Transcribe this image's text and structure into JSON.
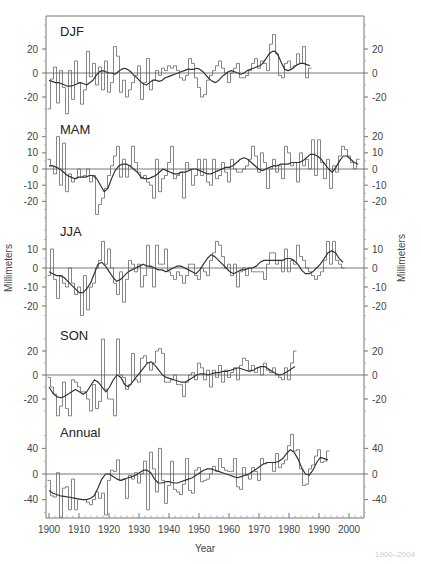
{
  "chart_data": {
    "type": "line",
    "subtype": "step-line with smoothed curve, 5 stacked panels",
    "xlabel": "Year",
    "ylabel_left": "Millimeters",
    "ylabel_right": "Millimeters",
    "xlim": [
      1899,
      2005
    ],
    "x_ticks": [
      1900,
      1910,
      1920,
      1930,
      1940,
      1950,
      1960,
      1970,
      1980,
      1990,
      2000
    ],
    "x_start": 1900,
    "grid": false,
    "legend": null,
    "panels": [
      {
        "name": "DJF",
        "ylim": [
          -32,
          45
        ],
        "y_ticks_left": [
          20,
          0,
          -20
        ],
        "y_ticks_right": [
          20,
          0,
          -20
        ],
        "annual": [
          -30,
          -5,
          5,
          -25,
          2,
          -12,
          -34,
          2,
          -22,
          10,
          -8,
          -26,
          -14,
          18,
          -3,
          8,
          -10,
          5,
          -14,
          10,
          -16,
          -8,
          22,
          14,
          -16,
          -6,
          -20,
          -14,
          -8,
          -2,
          6,
          -22,
          -8,
          12,
          -14,
          -6,
          2,
          -2,
          4,
          2,
          6,
          4,
          6,
          2,
          -4,
          -6,
          -2,
          12,
          8,
          -4,
          -12,
          -20,
          -18,
          -6,
          -2,
          2,
          6,
          10,
          4,
          0,
          -8,
          0,
          4,
          8,
          -4,
          -4,
          -2,
          2,
          8,
          12,
          4,
          10,
          8,
          2,
          24,
          32,
          16,
          -2,
          -4,
          8,
          10,
          4,
          6,
          16,
          8,
          22,
          -4,
          4
        ],
        "smoothed": [
          -6,
          -7,
          -8,
          -8,
          -9,
          -10,
          -11,
          -11,
          -10,
          -9,
          -8,
          -9,
          -10,
          -8,
          -6,
          -2,
          1,
          2,
          1,
          0,
          0,
          -1,
          1,
          3,
          4,
          3,
          1,
          -2,
          -4,
          -7,
          -9,
          -10,
          -8,
          -6,
          -6,
          -7,
          -6,
          -4,
          -3,
          -2,
          -1,
          0,
          1,
          2,
          3,
          3,
          3,
          4,
          3,
          1,
          -2,
          -5,
          -7,
          -8,
          -6,
          -3,
          -1,
          1,
          2,
          1,
          0,
          -1,
          0,
          2,
          3,
          4,
          5,
          6,
          8,
          12,
          16,
          18,
          18,
          14,
          8,
          3,
          2,
          3,
          5,
          7,
          8,
          8,
          7,
          6
        ]
      },
      {
        "name": "MAM",
        "ylim": [
          -30,
          28
        ],
        "y_ticks_left": [
          20,
          10,
          0,
          -10,
          -20
        ],
        "y_ticks_right": [
          20,
          10,
          0,
          -10,
          -20
        ],
        "annual": [
          6,
          2,
          -3,
          20,
          -10,
          16,
          -14,
          -3,
          -8,
          -6,
          0,
          -5,
          -4,
          0,
          -8,
          -4,
          -28,
          -22,
          -18,
          -12,
          -4,
          2,
          8,
          14,
          -5,
          6,
          -5,
          2,
          14,
          4,
          -2,
          -6,
          -4,
          -8,
          -10,
          -18,
          6,
          -14,
          -6,
          -4,
          4,
          14,
          -6,
          -4,
          -2,
          -18,
          4,
          0,
          -10,
          -4,
          6,
          -4,
          6,
          -8,
          -10,
          6,
          -6,
          -4,
          4,
          -2,
          -8,
          6,
          0,
          -2,
          -2,
          0,
          2,
          6,
          14,
          8,
          -2,
          10,
          4,
          -12,
          0,
          6,
          -2,
          2,
          -6,
          14,
          10,
          2,
          4,
          -8,
          10,
          2,
          6,
          0,
          18,
          -4,
          18,
          4,
          -6,
          6,
          -12,
          2,
          -2,
          8,
          14,
          12,
          8,
          4,
          0,
          6
        ],
        "smoothed": [
          2,
          2,
          1,
          0,
          -2,
          -4,
          -5,
          -6,
          -5,
          -5,
          -5,
          -4,
          -4,
          -6,
          -10,
          -14,
          -12,
          -6,
          -1,
          2,
          3,
          3,
          2,
          0,
          -2,
          -5,
          -6,
          -6,
          -5,
          -4,
          -2,
          0,
          -1,
          -2,
          -3,
          -3,
          -2,
          -2,
          -1,
          0,
          0,
          -1,
          -2,
          -3,
          -3,
          -2,
          -1,
          0,
          1,
          1,
          2,
          4,
          6,
          7,
          6,
          4,
          2,
          0,
          -1,
          0,
          1,
          2,
          2,
          3,
          3,
          3,
          4,
          4,
          4,
          5,
          7,
          9,
          9,
          8,
          6,
          3,
          0,
          -2,
          1,
          5,
          8,
          8,
          6,
          4,
          3
        ]
      },
      {
        "name": "JJA",
        "ylim": [
          -26,
          20
        ],
        "y_ticks_left": [
          10,
          0,
          -10,
          -20
        ],
        "y_ticks_right": [
          10,
          0,
          -10,
          -20
        ],
        "annual": [
          -4,
          10,
          -6,
          -16,
          -4,
          -8,
          -10,
          0,
          -8,
          -14,
          -10,
          -25,
          -4,
          -22,
          -10,
          -8,
          0,
          4,
          14,
          2,
          10,
          0,
          -8,
          -14,
          -2,
          -18,
          -6,
          4,
          2,
          -2,
          2,
          -10,
          -4,
          12,
          0,
          -10,
          12,
          2,
          2,
          10,
          -2,
          -4,
          -6,
          -2,
          -4,
          -8,
          -4,
          2,
          2,
          -4,
          -6,
          0,
          -2,
          -4,
          4,
          8,
          14,
          12,
          6,
          0,
          2,
          -4,
          2,
          -10,
          -2,
          0,
          -4,
          0,
          -2,
          -2,
          -2,
          -2,
          -6,
          2,
          8,
          8,
          2,
          4,
          -2,
          10,
          -2,
          4,
          2,
          12,
          6,
          4,
          0,
          -2,
          -4,
          -6,
          -4,
          -2,
          4,
          14,
          2,
          14,
          4,
          2,
          0
        ],
        "smoothed": [
          -2,
          -3,
          -4,
          -4,
          -5,
          -7,
          -9,
          -11,
          -13,
          -13,
          -11,
          -8,
          -3,
          2,
          3,
          1,
          -2,
          -5,
          -7,
          -6,
          -4,
          -2,
          -1,
          0,
          1,
          2,
          1,
          1,
          0,
          -1,
          -1,
          -2,
          -1,
          0,
          1,
          1,
          0,
          -1,
          -2,
          -3,
          -1,
          2,
          5,
          7,
          6,
          4,
          2,
          0,
          -2,
          -3,
          -2,
          -1,
          -1,
          0,
          0,
          1,
          3,
          4,
          4,
          4,
          4,
          4,
          4,
          5,
          5,
          4,
          2,
          -1,
          -3,
          -3,
          -2,
          0,
          2,
          5,
          8,
          9,
          8,
          5,
          3
        ]
      },
      {
        "name": "SON",
        "ylim": [
          -38,
          38
        ],
        "y_ticks_left": [
          20,
          0,
          -20
        ],
        "y_ticks_right": [
          20,
          0,
          -20
        ],
        "annual": [
          -2,
          -10,
          -16,
          -34,
          -26,
          -6,
          -28,
          -34,
          -4,
          -6,
          -10,
          -14,
          -14,
          -20,
          -30,
          -8,
          -28,
          -22,
          30,
          -12,
          -20,
          -20,
          -34,
          30,
          0,
          -2,
          -12,
          -8,
          18,
          -4,
          -6,
          14,
          16,
          10,
          4,
          10,
          20,
          22,
          18,
          -6,
          -6,
          -4,
          0,
          -8,
          -8,
          -18,
          -6,
          0,
          2,
          -4,
          10,
          6,
          -4,
          4,
          -10,
          4,
          -2,
          8,
          -6,
          4,
          -2,
          2,
          6,
          -4,
          8,
          14,
          12,
          4,
          8,
          2,
          6,
          0,
          10,
          4,
          2,
          6,
          0,
          -2,
          -4,
          6,
          -4,
          10,
          20
        ],
        "smoothed": [
          -10,
          -15,
          -18,
          -19,
          -18,
          -16,
          -14,
          -12,
          -14,
          -16,
          -14,
          -9,
          -4,
          -6,
          -10,
          -14,
          -10,
          -4,
          0,
          -2,
          -8,
          -10,
          -6,
          -2,
          2,
          6,
          10,
          11,
          8,
          4,
          0,
          -2,
          -3,
          -4,
          -5,
          -6,
          -6,
          -4,
          -2,
          0,
          1,
          1,
          0,
          1,
          2,
          2,
          3,
          3,
          4,
          5,
          6,
          5,
          4,
          3,
          4,
          6,
          7,
          7,
          5,
          3,
          1,
          0,
          1,
          3,
          5,
          7
        ]
      },
      {
        "name": "Annual",
        "ylim": [
          -72,
          78
        ],
        "y_ticks_left": [
          40,
          0,
          -40
        ],
        "y_ticks_right": [
          40,
          0,
          -40
        ],
        "annual": [
          -10,
          -34,
          -36,
          2,
          -68,
          -22,
          -20,
          -56,
          -8,
          -56,
          -40,
          -40,
          -40,
          -44,
          -48,
          -40,
          -28,
          -38,
          -30,
          -64,
          -10,
          6,
          4,
          22,
          -10,
          -8,
          -38,
          -2,
          -8,
          2,
          -14,
          0,
          20,
          -56,
          34,
          8,
          -28,
          40,
          -10,
          -46,
          -18,
          20,
          -24,
          -28,
          -32,
          -16,
          24,
          -26,
          -30,
          6,
          10,
          -12,
          -10,
          -8,
          0,
          12,
          4,
          24,
          10,
          6,
          4,
          4,
          24,
          -20,
          -24,
          10,
          -2,
          -8,
          10,
          4,
          -10,
          24,
          16,
          18,
          18,
          4,
          32,
          10,
          16,
          22,
          44,
          62,
          36,
          38,
          8,
          -18,
          -16,
          8,
          14,
          28,
          38,
          18,
          20,
          36
        ],
        "smoothed": [
          -26,
          -30,
          -32,
          -34,
          -35,
          -36,
          -37,
          -38,
          -39,
          -40,
          -40,
          -38,
          -34,
          -22,
          -8,
          0,
          0,
          -4,
          -8,
          -10,
          -8,
          -6,
          -4,
          -2,
          2,
          6,
          6,
          2,
          -8,
          -14,
          -14,
          -12,
          -12,
          -14,
          -14,
          -12,
          -10,
          -8,
          -6,
          -2,
          2,
          6,
          8,
          8,
          6,
          4,
          2,
          0,
          -2,
          -4,
          -6,
          -4,
          -2,
          0,
          4,
          8,
          12,
          16,
          18,
          18,
          18,
          20,
          24,
          32,
          38,
          34,
          24,
          10,
          0,
          -2,
          6,
          18,
          26,
          24,
          22
        ]
      }
    ]
  },
  "labels": {
    "x_axis_title": "Year",
    "y_axis_title_left": "Millimeters",
    "y_axis_title_right": "Millimeters",
    "footer_note": "1900–2004"
  }
}
